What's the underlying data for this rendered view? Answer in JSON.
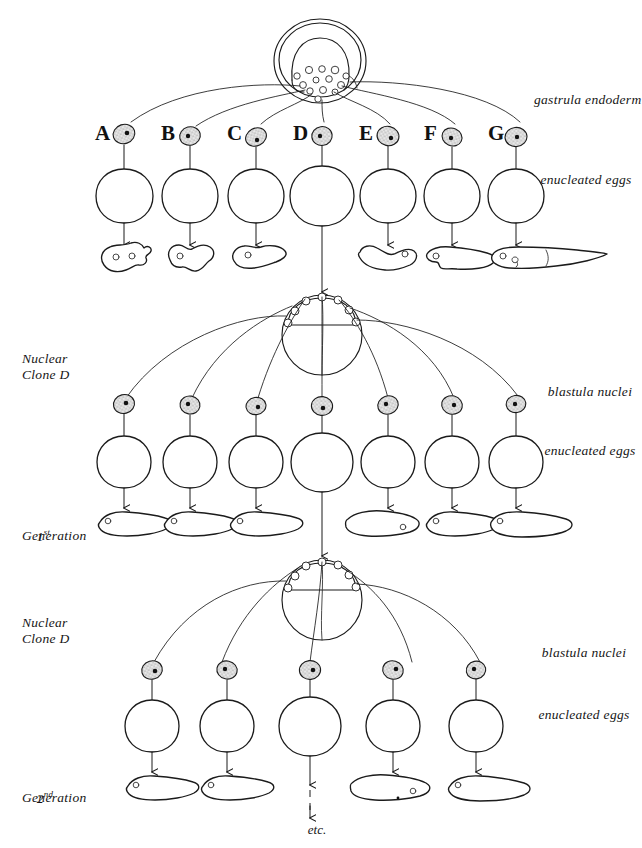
{
  "figure": {
    "background_color": "#ffffff",
    "ink_color": "#1b1b1b"
  },
  "top_section": {
    "source_label": "gastrula endoderm nuclei",
    "egg_label": "enucleated eggs",
    "column_letters": [
      "A",
      "B",
      "C",
      "D",
      "E",
      "F",
      "G"
    ],
    "donor_cell_count": 7,
    "outcome_note": "D continues to next generation"
  },
  "middle_section": {
    "clone_label_line1": "Nuclear",
    "clone_label_line2": "Clone D",
    "nuclei_label": "blastula nuclei",
    "egg_label": "enucleated eggs",
    "generation_line1": "1",
    "generation_sup1": "st",
    "generation_line2": "Generation",
    "column_count": 7
  },
  "bottom_section": {
    "clone_label_line1": "Nuclear",
    "clone_label_line2": "Clone D",
    "nuclei_label": "blastula nuclei",
    "egg_label": "enucleated eggs",
    "generation_line1": "2",
    "generation_sup1": "nd",
    "generation_line2": "Generation",
    "column_count": 5,
    "continue_label": "etc."
  },
  "icons": {
    "nucleus": "stippled-nucleus-icon",
    "egg": "enucleated-egg-icon",
    "gastrula": "gastrula-icon",
    "blastula": "blastula-icon",
    "larva": "tadpole-larva-icon",
    "abnormal": "abnormal-embryo-icon",
    "arrow": "down-arrow-icon",
    "dashed_arrow": "dashed-down-arrow-icon"
  }
}
